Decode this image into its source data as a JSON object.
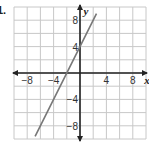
{
  "problem_label": "1.",
  "chart_data": {
    "type": "line",
    "title": "",
    "xlabel": "x",
    "ylabel": "y",
    "xlim": [
      -10,
      10
    ],
    "ylim": [
      -10,
      10
    ],
    "grid": true,
    "grid_step": 2,
    "x_ticks": [
      -8,
      -4,
      4,
      8
    ],
    "y_ticks": [
      8,
      4,
      -4,
      -8
    ],
    "x_tick_labels": [
      "−8",
      "−4",
      "4",
      "8"
    ],
    "y_tick_labels": [
      "8",
      "4",
      "−4",
      "−8"
    ],
    "series": [
      {
        "name": "line",
        "equation": "y = 2x + 4",
        "slope": 2,
        "y_intercept": 4,
        "x": [
          -6.8,
          2.5
        ],
        "y": [
          -9.6,
          9.0
        ],
        "color": "#777777"
      }
    ],
    "colors": {
      "grid": "#c8c8c8",
      "axes": "#222222",
      "line": "#777777"
    }
  }
}
